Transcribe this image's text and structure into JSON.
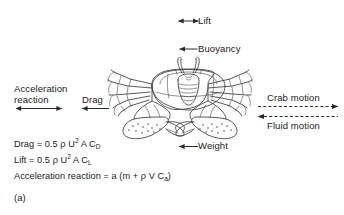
{
  "figure": {
    "panel_label": "(a)",
    "subject_icon": "crab-illustration",
    "background_color": "#ffffff",
    "ink_color": "#1a1a1a"
  },
  "force_labels": {
    "lift": "Lift",
    "buoyancy": "Buoyancy",
    "weight": "Weight",
    "drag": "Drag",
    "acceleration_reaction_line1": "Acceleration",
    "acceleration_reaction_line2": "reaction"
  },
  "motion_labels": {
    "crab_motion": "Crab motion",
    "fluid_motion": "Fluid motion"
  },
  "equations": [
    {
      "id": "drag-equation",
      "lhs": "Drag",
      "eq": "=",
      "coefficient": "0.5",
      "rho": "ρ",
      "velocity": "U",
      "velocity_exponent": "2",
      "area": "A",
      "coefficient_symbol": "C",
      "coefficient_subscript": "D"
    },
    {
      "id": "lift-equation",
      "lhs": "Lift",
      "eq": "=",
      "coefficient": "0.5",
      "rho": "ρ",
      "velocity": "U",
      "velocity_exponent": "2",
      "area": "A",
      "coefficient_symbol": "C",
      "coefficient_subscript": "L"
    },
    {
      "id": "acceleration-reaction-equation",
      "lhs": "Acceleration reaction",
      "eq": "=",
      "accel": "a",
      "open_paren": "(",
      "mass": "m",
      "plus": "+",
      "rho": "ρ",
      "volume": "V",
      "coefficient_symbol": "C",
      "coefficient_subscript": "a",
      "close_paren": ")"
    }
  ],
  "arrows": {
    "lift": {
      "name": "lift-arrow",
      "direction": "double-vertical",
      "style": "solid"
    },
    "buoyancy": {
      "name": "buoyancy-arrow",
      "direction": "up",
      "style": "solid"
    },
    "weight": {
      "name": "weight-arrow",
      "direction": "down",
      "style": "solid"
    },
    "drag": {
      "name": "drag-arrow",
      "direction": "left",
      "style": "solid"
    },
    "acceleration_reaction": {
      "name": "acceleration-reaction-arrow",
      "direction": "double-horizontal",
      "style": "solid"
    },
    "crab_motion": {
      "name": "crab-motion-arrow",
      "direction": "right",
      "style": "dashed"
    },
    "fluid_motion": {
      "name": "fluid-motion-arrow",
      "direction": "left",
      "style": "dashed"
    }
  }
}
